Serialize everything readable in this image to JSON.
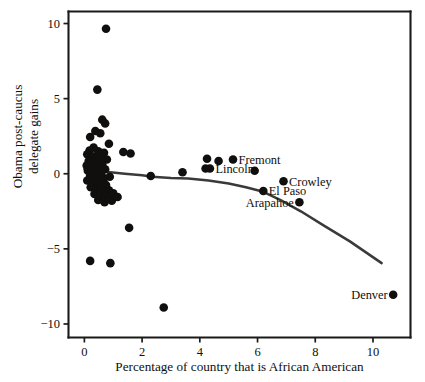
{
  "chart_data": {
    "type": "scatter",
    "title": "",
    "xlabel": "Percentage of country that is African American",
    "ylabel_line1": "Obama post-caucus",
    "ylabel_line2": "delegate gains",
    "ylabel": "Obama post-caucus delegate gains",
    "xlim": [
      -0.55,
      11.3
    ],
    "ylim": [
      -10.9,
      10.8
    ],
    "xticks": [
      0,
      2,
      4,
      6,
      8,
      10
    ],
    "xtick_labels": [
      "0",
      "2",
      "4",
      "6",
      "8",
      "10"
    ],
    "yticks": [
      10,
      5,
      0,
      -5,
      -10
    ],
    "ytick_labels": [
      "10",
      "5",
      "0",
      "−5",
      "−10"
    ],
    "grid": false,
    "legend": "none",
    "marker_color": "#110f0e",
    "trend_color": "#3a3a38",
    "axis_color": "#1a1a18",
    "background": "#ffffff",
    "series": [
      {
        "name": "Colorado counties",
        "points": [
          {
            "x": 0.75,
            "y": 9.65
          },
          {
            "x": 0.45,
            "y": 5.6
          },
          {
            "x": 0.62,
            "y": 3.6
          },
          {
            "x": 0.72,
            "y": 3.35
          },
          {
            "x": 0.38,
            "y": 2.85
          },
          {
            "x": 0.55,
            "y": 2.7
          },
          {
            "x": 0.2,
            "y": 2.45
          },
          {
            "x": 0.85,
            "y": 2.0
          },
          {
            "x": 0.32,
            "y": 1.75
          },
          {
            "x": 0.18,
            "y": 1.55
          },
          {
            "x": 0.48,
            "y": 1.5
          },
          {
            "x": 0.68,
            "y": 1.4
          },
          {
            "x": 0.1,
            "y": 1.3
          },
          {
            "x": 0.3,
            "y": 1.15
          },
          {
            "x": 0.55,
            "y": 1.05
          },
          {
            "x": 0.78,
            "y": 0.95
          },
          {
            "x": 0.15,
            "y": 0.85
          },
          {
            "x": 0.4,
            "y": 0.75
          },
          {
            "x": 0.62,
            "y": 0.62
          },
          {
            "x": 0.08,
            "y": 0.55
          },
          {
            "x": 0.26,
            "y": 0.45
          },
          {
            "x": 0.5,
            "y": 0.4
          },
          {
            "x": 0.72,
            "y": 0.3
          },
          {
            "x": 0.12,
            "y": 0.2
          },
          {
            "x": 0.35,
            "y": 0.1
          },
          {
            "x": 0.58,
            "y": 0.0
          },
          {
            "x": 0.2,
            "y": -0.15
          },
          {
            "x": 0.45,
            "y": -0.25
          },
          {
            "x": 0.68,
            "y": -0.3
          },
          {
            "x": 0.88,
            "y": -0.2
          },
          {
            "x": 0.1,
            "y": -0.45
          },
          {
            "x": 0.3,
            "y": -0.55
          },
          {
            "x": 0.52,
            "y": -0.65
          },
          {
            "x": 0.75,
            "y": -0.75
          },
          {
            "x": 0.22,
            "y": -0.9
          },
          {
            "x": 0.42,
            "y": -1.0
          },
          {
            "x": 0.62,
            "y": -1.15
          },
          {
            "x": 0.85,
            "y": -1.1
          },
          {
            "x": 0.35,
            "y": -1.35
          },
          {
            "x": 0.55,
            "y": -1.5
          },
          {
            "x": 0.78,
            "y": -1.45
          },
          {
            "x": 1.0,
            "y": -1.3
          },
          {
            "x": 0.48,
            "y": -1.75
          },
          {
            "x": 0.7,
            "y": -1.9
          },
          {
            "x": 0.95,
            "y": -1.8
          },
          {
            "x": 1.15,
            "y": -1.55
          },
          {
            "x": 1.35,
            "y": 1.45
          },
          {
            "x": 1.6,
            "y": 1.35
          },
          {
            "x": 1.55,
            "y": -3.6
          },
          {
            "x": 0.2,
            "y": -5.8
          },
          {
            "x": 0.9,
            "y": -5.95
          },
          {
            "x": 2.75,
            "y": -8.9
          },
          {
            "x": 2.3,
            "y": -0.15
          },
          {
            "x": 3.4,
            "y": 0.1
          },
          {
            "x": 4.25,
            "y": 1.0
          },
          {
            "x": 4.65,
            "y": 0.85
          },
          {
            "x": 4.2,
            "y": 0.35
          },
          {
            "x": 5.9,
            "y": 0.2
          }
        ]
      }
    ],
    "labeled_points": [
      {
        "label": "Fremont",
        "x": 5.15,
        "y": 0.95,
        "label_side": "right"
      },
      {
        "label": "Lincoln",
        "x": 4.35,
        "y": 0.35,
        "label_side": "right"
      },
      {
        "label": "Crowley",
        "x": 6.9,
        "y": -0.5,
        "label_side": "right"
      },
      {
        "label": "El Paso",
        "x": 6.2,
        "y": -1.15,
        "label_side": "right"
      },
      {
        "label": "Arapahoe",
        "x": 7.45,
        "y": -1.9,
        "label_side": "left"
      },
      {
        "label": "Denver",
        "x": 10.7,
        "y": -8.05,
        "label_side": "left"
      }
    ],
    "trend": {
      "name": "lowess smoother",
      "points": [
        {
          "x": 0.0,
          "y": 0.32
        },
        {
          "x": 0.45,
          "y": 0.2
        },
        {
          "x": 0.9,
          "y": 0.1
        },
        {
          "x": 1.4,
          "y": 0.0
        },
        {
          "x": 2.0,
          "y": -0.1
        },
        {
          "x": 2.35,
          "y": -0.2
        },
        {
          "x": 3.0,
          "y": -0.28
        },
        {
          "x": 3.6,
          "y": -0.32
        },
        {
          "x": 4.3,
          "y": -0.45
        },
        {
          "x": 5.0,
          "y": -0.65
        },
        {
          "x": 5.6,
          "y": -0.9
        },
        {
          "x": 6.2,
          "y": -1.2
        },
        {
          "x": 6.8,
          "y": -1.75
        },
        {
          "x": 7.5,
          "y": -2.5
        },
        {
          "x": 8.3,
          "y": -3.45
        },
        {
          "x": 9.2,
          "y": -4.5
        },
        {
          "x": 10.3,
          "y": -5.95
        }
      ]
    }
  }
}
